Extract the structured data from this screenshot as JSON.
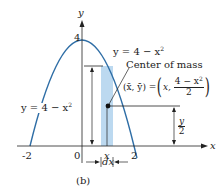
{
  "figure": {
    "caption": "(b)",
    "axes": {
      "x_label": "x",
      "y_label": "y",
      "x_ticks": [
        "-2",
        "0",
        "2"
      ],
      "y_ticks": [
        "4"
      ],
      "x_tick_x": "x"
    },
    "curve": {
      "equation": "y = 4 − x²",
      "eq_lhs": "y = 4 − x",
      "eq_exp": "2",
      "color": "#2f6ea6"
    },
    "strip": {
      "color": "#bcd9f0",
      "width_label": "dx",
      "height_label_lhs": "y = 4 − x",
      "height_label_exp": "2"
    },
    "center_of_mass": {
      "label": "Center of mass",
      "coords_lhs": "(x̄, ȳ) = ",
      "coords_x": "x,",
      "frac_num_lhs": "4 − x",
      "frac_num_exp": "2",
      "frac_den": "2"
    },
    "half_height": {
      "num": "y",
      "den": "2"
    },
    "colors": {
      "axis": "#222222",
      "curve": "#2f6ea6",
      "strip": "#bcd9f0",
      "dot": "#111111"
    }
  }
}
